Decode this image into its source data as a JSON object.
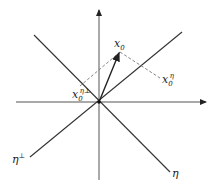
{
  "diagram": {
    "labels": {
      "x0": "x",
      "x0_sub": "0",
      "x0_eta": "x",
      "x0_eta_sub": "0",
      "x0_eta_sup": "η",
      "x0_perp": "x",
      "x0_perp_sub": "0",
      "x0_perp_sup": "η⊥",
      "eta": "η",
      "eta_perp": "η",
      "eta_perp_sup": "⊥"
    },
    "colors": {
      "line": "#333333",
      "dashed": "#777777",
      "text": "#222222"
    }
  }
}
